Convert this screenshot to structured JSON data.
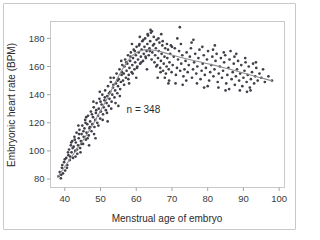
{
  "figure": {
    "border_color": "#c9c9c9",
    "background": "#ffffff"
  },
  "chart_data": {
    "type": "scatter",
    "title": "",
    "subtitle": "",
    "xlabel": "Menstrual age of embryo",
    "ylabel": "Embryonic heart rate (BPM)",
    "xlim": [
      36,
      101.5
    ],
    "ylim": [
      74,
      192
    ],
    "xticks": [
      40,
      50,
      60,
      70,
      80,
      90,
      100
    ],
    "xtick_labels": [
      "40",
      "50",
      "60",
      "70",
      "80",
      "90",
      "100"
    ],
    "yticks": [
      80,
      100,
      120,
      140,
      160,
      180
    ],
    "ytick_labels": [
      "80",
      "100",
      "120",
      "140",
      "160",
      "180"
    ],
    "grid": false,
    "legend": null,
    "legend_position": "none",
    "annotations": [
      {
        "text": "n = 348",
        "x": 62,
        "y": 127
      }
    ],
    "point_color": "#40404a",
    "point_size": 1.35,
    "trend_line": {
      "name": "smoothed fit",
      "color": "#8d8d8d",
      "x": [
        38.0,
        39.5,
        41.0,
        42.5,
        44.0,
        45.5,
        47.0,
        48.5,
        50.0,
        51.5,
        53.0,
        54.5,
        56.0,
        57.5,
        59.0,
        60.5,
        62.0,
        63.5,
        65.0,
        66.5,
        68.0,
        70.0,
        72.0,
        74.0,
        76.0,
        78.0,
        80.0,
        82.0,
        84.0,
        86.0,
        88.0,
        90.0,
        92.0,
        94.0,
        96.0,
        98.0
      ],
      "y": [
        81.5,
        87.0,
        92.5,
        98.0,
        103.5,
        109.0,
        115.0,
        121.5,
        128.5,
        135.5,
        143.0,
        150.5,
        157.5,
        163.5,
        168.0,
        170.6,
        171.8,
        172.0,
        171.6,
        170.8,
        169.7,
        168.2,
        166.8,
        165.5,
        164.3,
        163.2,
        162.0,
        160.8,
        159.5,
        158.2,
        156.8,
        155.4,
        154.0,
        152.6,
        151.2,
        149.8
      ]
    },
    "points": [
      [
        38.2,
        82.0
      ],
      [
        38.6,
        85.0
      ],
      [
        38.9,
        80.5
      ],
      [
        39.2,
        88.0
      ],
      [
        39.5,
        84.0
      ],
      [
        39.8,
        92.0
      ],
      [
        40.1,
        86.0
      ],
      [
        40.4,
        95.0
      ],
      [
        40.7,
        90.0
      ],
      [
        41.0,
        97.0
      ],
      [
        41.2,
        101.0
      ],
      [
        41.4,
        93.5
      ],
      [
        41.7,
        104.0
      ],
      [
        41.9,
        99.0
      ],
      [
        42.1,
        107.0
      ],
      [
        42.3,
        95.0
      ],
      [
        42.5,
        103.0
      ],
      [
        42.7,
        110.0
      ],
      [
        42.9,
        100.0
      ],
      [
        43.1,
        106.0
      ],
      [
        43.3,
        113.0
      ],
      [
        43.5,
        98.0
      ],
      [
        43.7,
        104.0
      ],
      [
        43.9,
        109.0
      ],
      [
        44.1,
        115.0
      ],
      [
        44.3,
        102.0
      ],
      [
        44.5,
        107.0
      ],
      [
        44.7,
        112.0
      ],
      [
        44.9,
        118.0
      ],
      [
        45.1,
        105.0
      ],
      [
        45.3,
        110.0
      ],
      [
        45.5,
        116.0
      ],
      [
        45.7,
        122.0
      ],
      [
        45.9,
        108.0
      ],
      [
        46.1,
        113.0
      ],
      [
        46.3,
        119.0
      ],
      [
        46.5,
        125.0
      ],
      [
        46.7,
        111.0
      ],
      [
        46.9,
        116.0
      ],
      [
        47.1,
        121.0
      ],
      [
        47.3,
        128.0
      ],
      [
        47.5,
        114.0
      ],
      [
        47.7,
        119.0
      ],
      [
        47.9,
        124.0
      ],
      [
        48.1,
        131.0
      ],
      [
        48.3,
        117.0
      ],
      [
        48.5,
        122.0
      ],
      [
        48.7,
        127.0
      ],
      [
        48.9,
        134.0
      ],
      [
        49.1,
        120.0
      ],
      [
        49.3,
        125.0
      ],
      [
        49.5,
        130.0
      ],
      [
        49.7,
        137.0
      ],
      [
        49.9,
        123.0
      ],
      [
        50.1,
        128.0
      ],
      [
        50.3,
        133.0
      ],
      [
        50.5,
        140.0
      ],
      [
        50.7,
        126.0
      ],
      [
        50.9,
        131.0
      ],
      [
        51.1,
        136.0
      ],
      [
        51.3,
        143.0
      ],
      [
        51.5,
        129.0
      ],
      [
        51.7,
        134.0
      ],
      [
        51.9,
        139.0
      ],
      [
        52.1,
        146.0
      ],
      [
        52.3,
        132.0
      ],
      [
        52.5,
        137.0
      ],
      [
        52.7,
        142.0
      ],
      [
        52.9,
        149.0
      ],
      [
        53.1,
        135.0
      ],
      [
        53.3,
        140.0
      ],
      [
        53.5,
        145.0
      ],
      [
        53.7,
        152.0
      ],
      [
        53.9,
        138.0
      ],
      [
        54.1,
        143.0
      ],
      [
        54.3,
        148.0
      ],
      [
        54.5,
        155.0
      ],
      [
        54.7,
        141.0
      ],
      [
        54.9,
        146.0
      ],
      [
        55.1,
        151.0
      ],
      [
        55.3,
        158.0
      ],
      [
        55.5,
        144.0
      ],
      [
        55.7,
        149.0
      ],
      [
        55.9,
        154.0
      ],
      [
        56.1,
        161.0
      ],
      [
        56.3,
        150.0
      ],
      [
        56.5,
        155.0
      ],
      [
        56.7,
        160.0
      ],
      [
        56.9,
        165.0
      ],
      [
        57.1,
        152.0
      ],
      [
        57.3,
        157.0
      ],
      [
        57.5,
        162.0
      ],
      [
        57.7,
        168.0
      ],
      [
        57.9,
        154.0
      ],
      [
        58.1,
        159.0
      ],
      [
        58.3,
        164.0
      ],
      [
        58.5,
        170.0
      ],
      [
        58.7,
        156.0
      ],
      [
        58.9,
        161.0
      ],
      [
        59.1,
        166.0
      ],
      [
        59.3,
        172.0
      ],
      [
        59.5,
        158.0
      ],
      [
        59.7,
        163.0
      ],
      [
        59.9,
        168.0
      ],
      [
        60.1,
        174.0
      ],
      [
        60.3,
        160.0
      ],
      [
        60.5,
        165.0
      ],
      [
        60.7,
        170.0
      ],
      [
        60.9,
        176.0
      ],
      [
        61.1,
        162.0
      ],
      [
        61.3,
        167.0
      ],
      [
        61.5,
        172.0
      ],
      [
        61.7,
        178.0
      ],
      [
        61.9,
        164.0
      ],
      [
        62.1,
        169.0
      ],
      [
        62.3,
        174.0
      ],
      [
        62.5,
        180.0
      ],
      [
        62.7,
        166.0
      ],
      [
        62.9,
        171.0
      ],
      [
        63.1,
        176.0
      ],
      [
        63.3,
        182.0
      ],
      [
        63.5,
        168.0
      ],
      [
        63.7,
        173.0
      ],
      [
        63.9,
        178.0
      ],
      [
        64.1,
        184.0
      ],
      [
        64.3,
        165.0
      ],
      [
        64.5,
        170.0
      ],
      [
        64.7,
        175.0
      ],
      [
        64.9,
        181.0
      ],
      [
        65.1,
        163.0
      ],
      [
        65.3,
        168.0
      ],
      [
        65.5,
        173.0
      ],
      [
        65.7,
        179.0
      ],
      [
        65.9,
        161.0
      ],
      [
        66.1,
        166.0
      ],
      [
        66.3,
        171.0
      ],
      [
        66.5,
        177.0
      ],
      [
        66.7,
        159.0
      ],
      [
        66.9,
        164.0
      ],
      [
        67.1,
        169.0
      ],
      [
        67.3,
        175.0
      ],
      [
        67.5,
        157.0
      ],
      [
        67.7,
        162.0
      ],
      [
        67.9,
        167.0
      ],
      [
        68.1,
        173.0
      ],
      [
        68.3,
        155.0
      ],
      [
        68.5,
        160.0
      ],
      [
        68.7,
        166.0
      ],
      [
        68.9,
        172.0
      ],
      [
        69.1,
        158.0
      ],
      [
        69.3,
        163.0
      ],
      [
        69.5,
        169.0
      ],
      [
        69.7,
        175.0
      ],
      [
        69.9,
        156.0
      ],
      [
        70.2,
        161.0
      ],
      [
        70.5,
        167.0
      ],
      [
        70.8,
        173.0
      ],
      [
        71.1,
        154.0
      ],
      [
        71.4,
        159.0
      ],
      [
        71.7,
        165.0
      ],
      [
        72.0,
        171.0
      ],
      [
        72.3,
        157.0
      ],
      [
        72.6,
        162.0
      ],
      [
        72.9,
        168.0
      ],
      [
        72.2,
        188.0
      ],
      [
        73.2,
        153.0
      ],
      [
        73.5,
        158.0
      ],
      [
        73.8,
        164.0
      ],
      [
        74.1,
        170.0
      ],
      [
        74.4,
        156.0
      ],
      [
        74.7,
        161.0
      ],
      [
        75.0,
        167.0
      ],
      [
        75.3,
        173.0
      ],
      [
        75.6,
        152.0
      ],
      [
        75.9,
        158.0
      ],
      [
        76.2,
        163.0
      ],
      [
        76.5,
        169.0
      ],
      [
        76.8,
        155.0
      ],
      [
        77.1,
        160.0
      ],
      [
        77.4,
        166.0
      ],
      [
        77.7,
        172.0
      ],
      [
        78.0,
        151.0
      ],
      [
        78.3,
        157.0
      ],
      [
        78.6,
        162.0
      ],
      [
        78.9,
        168.0
      ],
      [
        79.2,
        154.0
      ],
      [
        79.5,
        159.0
      ],
      [
        79.8,
        165.0
      ],
      [
        80.1,
        171.0
      ],
      [
        80.4,
        150.0
      ],
      [
        80.7,
        156.0
      ],
      [
        81.0,
        161.0
      ],
      [
        81.3,
        167.0
      ],
      [
        81.6,
        153.0
      ],
      [
        81.9,
        158.0
      ],
      [
        82.2,
        164.0
      ],
      [
        82.5,
        169.0
      ],
      [
        82.8,
        149.0
      ],
      [
        83.1,
        155.0
      ],
      [
        83.4,
        160.0
      ],
      [
        83.7,
        166.0
      ],
      [
        84.0,
        152.0
      ],
      [
        84.3,
        157.0
      ],
      [
        84.6,
        163.0
      ],
      [
        84.9,
        168.0
      ],
      [
        85.2,
        148.0
      ],
      [
        85.5,
        154.0
      ],
      [
        85.8,
        159.0
      ],
      [
        86.1,
        165.0
      ],
      [
        86.4,
        171.0
      ],
      [
        86.7,
        151.0
      ],
      [
        87.0,
        156.0
      ],
      [
        87.3,
        162.0
      ],
      [
        87.6,
        147.0
      ],
      [
        87.9,
        153.0
      ],
      [
        88.2,
        158.0
      ],
      [
        88.5,
        164.0
      ],
      [
        88.8,
        150.0
      ],
      [
        89.1,
        155.0
      ],
      [
        89.4,
        161.0
      ],
      [
        89.7,
        146.0
      ],
      [
        90.0,
        152.0
      ],
      [
        90.3,
        157.0
      ],
      [
        90.6,
        163.0
      ],
      [
        90.9,
        149.0
      ],
      [
        91.2,
        154.0
      ],
      [
        91.5,
        160.0
      ],
      [
        91.8,
        145.0
      ],
      [
        92.1,
        151.0
      ],
      [
        92.4,
        156.0
      ],
      [
        92.7,
        162.0
      ],
      [
        93.0,
        148.0
      ],
      [
        93.3,
        153.0
      ],
      [
        93.6,
        159.0
      ],
      [
        94.0,
        150.0
      ],
      [
        94.5,
        155.0
      ],
      [
        95.0,
        152.0
      ],
      [
        95.5,
        158.0
      ],
      [
        96.0,
        149.0
      ],
      [
        97.0,
        153.0
      ],
      [
        98.0,
        150.0
      ],
      [
        40.9,
        99.0
      ],
      [
        41.5,
        96.0
      ],
      [
        42.2,
        102.0
      ],
      [
        42.8,
        108.0
      ],
      [
        43.4,
        101.0
      ],
      [
        44.0,
        112.0
      ],
      [
        44.6,
        105.0
      ],
      [
        45.2,
        114.0
      ],
      [
        45.8,
        120.0
      ],
      [
        46.4,
        109.0
      ],
      [
        47.0,
        117.0
      ],
      [
        47.6,
        126.0
      ],
      [
        48.2,
        112.0
      ],
      [
        48.8,
        129.0
      ],
      [
        49.4,
        118.0
      ],
      [
        50.0,
        135.0
      ],
      [
        50.6,
        122.0
      ],
      [
        51.2,
        138.0
      ],
      [
        51.8,
        127.0
      ],
      [
        52.4,
        141.0
      ],
      [
        53.0,
        130.0
      ],
      [
        53.6,
        147.0
      ],
      [
        54.2,
        134.0
      ],
      [
        54.8,
        150.0
      ],
      [
        55.4,
        139.0
      ],
      [
        56.0,
        156.0
      ],
      [
        56.6,
        147.0
      ],
      [
        57.2,
        163.0
      ],
      [
        57.8,
        151.0
      ],
      [
        58.4,
        167.0
      ],
      [
        59.0,
        155.0
      ],
      [
        59.6,
        171.0
      ],
      [
        60.2,
        159.0
      ],
      [
        60.8,
        175.0
      ],
      [
        61.4,
        163.0
      ],
      [
        62.0,
        179.0
      ],
      [
        62.6,
        167.0
      ],
      [
        63.2,
        183.0
      ],
      [
        63.8,
        171.0
      ],
      [
        64.4,
        185.0
      ],
      [
        65.0,
        176.0
      ],
      [
        65.6,
        160.0
      ],
      [
        66.2,
        180.0
      ],
      [
        66.8,
        156.0
      ],
      [
        67.4,
        178.0
      ],
      [
        68.0,
        152.0
      ],
      [
        68.6,
        176.0
      ],
      [
        69.2,
        150.0
      ],
      [
        70.0,
        174.0
      ],
      [
        71.0,
        148.0
      ],
      [
        72.5,
        176.0
      ],
      [
        74.0,
        150.0
      ],
      [
        75.5,
        177.0
      ],
      [
        77.0,
        148.0
      ],
      [
        78.5,
        174.0
      ],
      [
        80.0,
        146.0
      ],
      [
        81.5,
        172.0
      ],
      [
        83.0,
        145.0
      ],
      [
        84.5,
        170.0
      ],
      [
        86.0,
        144.0
      ],
      [
        87.5,
        167.0
      ],
      [
        89.0,
        143.0
      ],
      [
        90.5,
        166.0
      ],
      [
        92.0,
        143.0
      ],
      [
        39.0,
        83.0
      ],
      [
        39.3,
        90.0
      ],
      [
        40.0,
        94.0
      ],
      [
        40.6,
        88.0
      ],
      [
        41.8,
        106.0
      ],
      [
        43.0,
        96.0
      ],
      [
        43.8,
        118.0
      ],
      [
        44.4,
        99.0
      ],
      [
        46.0,
        124.0
      ],
      [
        46.8,
        104.0
      ],
      [
        48.0,
        135.0
      ],
      [
        48.6,
        109.0
      ],
      [
        49.8,
        142.0
      ],
      [
        52.0,
        121.0
      ],
      [
        52.8,
        152.0
      ],
      [
        55.0,
        132.0
      ],
      [
        55.8,
        164.0
      ],
      [
        58.0,
        148.0
      ],
      [
        58.8,
        176.0
      ],
      [
        60.0,
        152.0
      ],
      [
        61.0,
        181.0
      ],
      [
        63.0,
        158.0
      ],
      [
        64.0,
        186.0
      ],
      [
        66.0,
        152.0
      ],
      [
        67.0,
        183.0
      ],
      [
        69.0,
        148.0
      ],
      [
        71.5,
        180.0
      ],
      [
        73.0,
        147.0
      ],
      [
        76.0,
        179.0
      ],
      [
        79.0,
        145.0
      ],
      [
        82.0,
        175.0
      ],
      [
        85.0,
        143.0
      ],
      [
        88.0,
        169.0
      ],
      [
        91.0,
        142.0
      ],
      [
        93.5,
        163.0
      ]
    ]
  }
}
